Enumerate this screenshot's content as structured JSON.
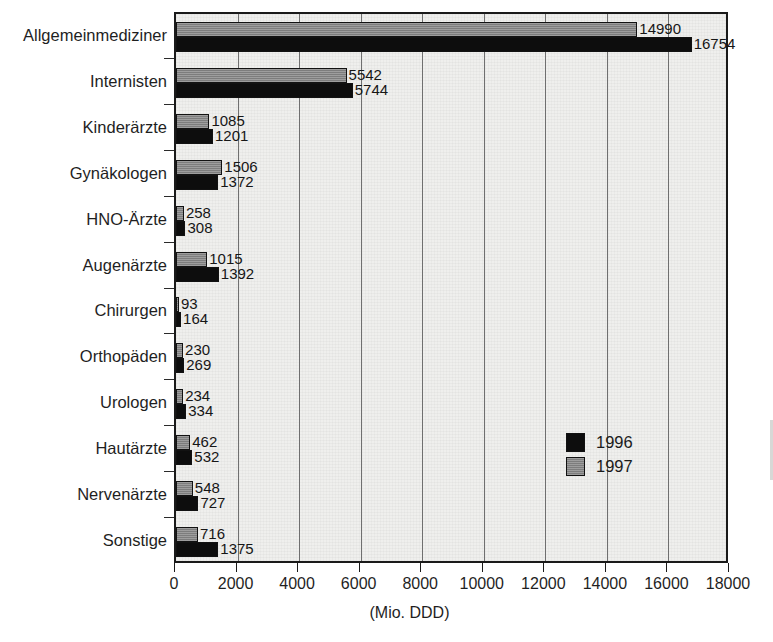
{
  "chart_data": {
    "type": "bar",
    "orientation": "horizontal",
    "title": "",
    "xlabel": "(Mio. DDD)",
    "ylabel": "",
    "xlim": [
      0,
      18000
    ],
    "xticks": [
      0,
      2000,
      4000,
      6000,
      8000,
      10000,
      12000,
      14000,
      16000,
      18000
    ],
    "grid": "vertical",
    "legend_position": "center-right",
    "categories": [
      "Allgemeinmediziner",
      "Internisten",
      "Kinderärzte",
      "Gynäkologen",
      "HNO-Ärzte",
      "Augenärzte",
      "Chirurgen",
      "Orthopäden",
      "Urologen",
      "Hautärzte",
      "Nervenärzte",
      "Sonstige"
    ],
    "series": [
      {
        "name": "1997",
        "color": "#8b8b8b",
        "values": [
          14990,
          5542,
          1085,
          1506,
          258,
          1015,
          93,
          230,
          234,
          462,
          548,
          716
        ]
      },
      {
        "name": "1996",
        "color": "#0d0d0d",
        "values": [
          16754,
          5744,
          1201,
          1372,
          308,
          1392,
          164,
          269,
          334,
          532,
          727,
          1375
        ]
      }
    ]
  },
  "legend": {
    "entries": [
      {
        "label": "1996",
        "color": "#0d0d0d"
      },
      {
        "label": "1997",
        "color": "#8b8b8b"
      }
    ]
  },
  "axis": {
    "x_title": "(Mio. DDD)"
  }
}
